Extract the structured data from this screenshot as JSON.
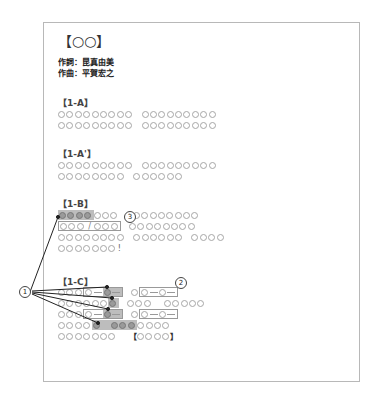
{
  "document": {
    "title": "【○○】",
    "lyricist": "作詞：昆真由美",
    "composer": "作曲：平賀宏之"
  },
  "sections": [
    {
      "label": "【1-A】"
    },
    {
      "label": "【1-A'】"
    },
    {
      "label": "【1-B】"
    },
    {
      "label": "【1-C】"
    }
  ],
  "annotations": {
    "marker_1": "1",
    "marker_2": "2",
    "marker_3": "3"
  },
  "glyphs": {
    "slash": "/",
    "exclaim": "!",
    "open_bracket": "【",
    "close_bracket": "】"
  },
  "colors": {
    "circle_border": "#a6a6a6",
    "shade": "#bdbdbd",
    "shaded_circle": "#9a9a9a",
    "page_border": "#b8b8b8"
  }
}
